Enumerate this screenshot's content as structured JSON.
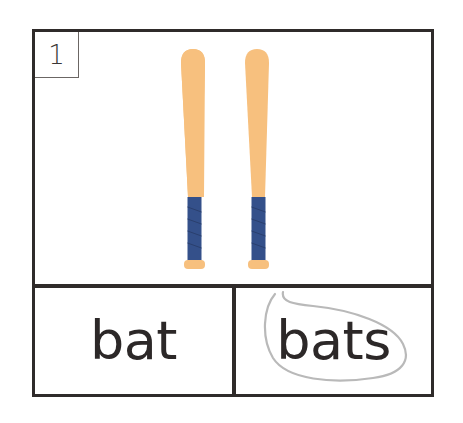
{
  "card": {
    "number": "1",
    "picture": {
      "subject": "two baseball bats",
      "count": 2,
      "bat_color": "#f7c07e",
      "grip_color": "#34508a"
    },
    "choices": [
      {
        "word": "bat",
        "circled": false
      },
      {
        "word": "bats",
        "circled": true
      }
    ],
    "circle_color": "#b9b9b9",
    "border_color": "#2f2b2a"
  }
}
